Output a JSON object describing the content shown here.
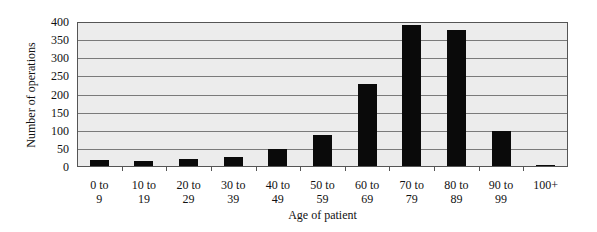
{
  "chart_data": {
    "type": "bar",
    "title": "",
    "xlabel": "Age of patient",
    "ylabel": "Number of operations",
    "ylim": [
      0,
      400
    ],
    "yticks": [
      0,
      50,
      100,
      150,
      200,
      250,
      300,
      350,
      400
    ],
    "grid": true,
    "legend": null,
    "categories": [
      "0 to 9",
      "10 to 19",
      "20 to 29",
      "30 to 39",
      "40 to 49",
      "50 to 59",
      "60 to 69",
      "70 to 79",
      "80 to 89",
      "90 to 99",
      "100+"
    ],
    "category_lines": [
      [
        "0 to",
        "9"
      ],
      [
        "10 to",
        "19"
      ],
      [
        "20 to",
        "29"
      ],
      [
        "30 to",
        "39"
      ],
      [
        "40 to",
        "49"
      ],
      [
        "50 to",
        "59"
      ],
      [
        "60 to",
        "69"
      ],
      [
        "70 to",
        "79"
      ],
      [
        "80 to",
        "89"
      ],
      [
        "90 to",
        "99"
      ],
      [
        "100+",
        ""
      ]
    ],
    "values": [
      17,
      15,
      19,
      24,
      48,
      86,
      229,
      392,
      378,
      96,
      2
    ],
    "colors": {
      "bar": "#0a0a0a",
      "plot_background": "#ececec",
      "gridline": "#7a7a7a"
    }
  }
}
